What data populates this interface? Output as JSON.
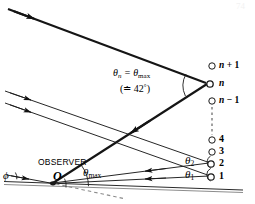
{
  "figure": {
    "background_color": "#ffffff",
    "ink_color": "#000000",
    "width": 255,
    "height": 204
  },
  "labels": {
    "observer": "OBSERVER",
    "origin": "O",
    "phi": "ϕ",
    "theta_max_lower": "θ",
    "theta_max_lower_sub": "max",
    "formula_lead": "θ",
    "formula_lead_sub": "n",
    "formula_eq": " = θ",
    "formula_eq_sub": "max",
    "formula_paren": "(≐ 42",
    "formula_paren_deg": "°",
    "formula_paren_close": ")",
    "theta_one": "θ",
    "theta_one_sub": "1",
    "theta_two": "θ",
    "theta_two_sub": "2",
    "corner_mark": "74"
  },
  "drop_column": {
    "description": "Vertical column of raindrops drawn as small open circles with index labels",
    "items": [
      {
        "id": "n-plus-1",
        "label_prefix": "n",
        "label_suffix": " + 1",
        "cx": 212,
        "cy": 66,
        "r": 3.2,
        "filled": false
      },
      {
        "id": "n",
        "label_prefix": "n",
        "label_suffix": "",
        "cx": 212,
        "cy": 84,
        "r": 3.2,
        "filled": false
      },
      {
        "id": "n-minus-1",
        "label_prefix": "n",
        "label_suffix": " − 1",
        "cx": 212,
        "cy": 101,
        "r": 3.2,
        "filled": false
      },
      {
        "id": "drop-4",
        "label_prefix": "4",
        "label_suffix": "",
        "cx": 212,
        "cy": 140,
        "r": 3.2,
        "filled": false
      },
      {
        "id": "drop-3",
        "label_prefix": "3",
        "label_suffix": "",
        "cx": 212,
        "cy": 152,
        "r": 3.2,
        "filled": false
      },
      {
        "id": "drop-2",
        "label_prefix": "2",
        "label_suffix": "",
        "cx": 212,
        "cy": 164,
        "r": 3.2,
        "filled": false
      },
      {
        "id": "drop-1",
        "label_prefix": "1",
        "label_suffix": "",
        "cx": 212,
        "cy": 177,
        "r": 3.2,
        "filled": false
      }
    ],
    "dashed_connector": {
      "x": 212,
      "y_from": 106,
      "y_to": 135
    }
  },
  "rays": {
    "incoming_top": {
      "from": [
        8,
        9
      ],
      "to": [
        208,
        84
      ],
      "width": 2.0,
      "arrow_at": [
        27,
        16
      ]
    },
    "reflected_down": {
      "from": [
        208,
        84
      ],
      "to": [
        52,
        183
      ],
      "width": 2.0,
      "arrow_at": [
        128,
        107
      ]
    },
    "incoming_mid_a": {
      "from": [
        6,
        92
      ],
      "to": [
        210,
        163
      ],
      "width": 1.0,
      "arrow_at": [
        24,
        98
      ]
    },
    "incoming_mid_b": {
      "from": [
        6,
        104
      ],
      "to": [
        210,
        176
      ],
      "width": 1.0,
      "arrow_at": [
        24,
        110
      ]
    },
    "to_observer_2": {
      "from": [
        210,
        163
      ],
      "to": [
        52,
        183
      ],
      "width": 1.0,
      "arrow_at": [
        146,
        171
      ]
    },
    "to_observer_1": {
      "from": [
        210,
        176
      ],
      "to": [
        52,
        183
      ],
      "width": 1.0,
      "arrow_at": [
        146,
        179
      ]
    },
    "horizon_line": {
      "from": [
        4,
        182
      ],
      "to": [
        240,
        190
      ],
      "width": 1.0
    },
    "phi_ray": {
      "from": [
        8,
        176
      ],
      "to": [
        52,
        183
      ],
      "width": 1.0,
      "arrow_at": [
        26,
        179
      ]
    },
    "dashed_axis": {
      "from": [
        56,
        184
      ],
      "to": [
        124,
        199
      ]
    }
  },
  "angle_arcs": [
    {
      "id": "arc-theta-max",
      "cx": 52,
      "cy": 183,
      "r": 36,
      "note": "angle at observer between horizon and upward ray"
    },
    {
      "id": "arc-phi",
      "cx": 8,
      "cy": 177,
      "r": 9,
      "note": "phi angle at far left"
    },
    {
      "id": "arc-theta-n",
      "cx": 208,
      "cy": 84,
      "r": 24,
      "note": "angle at drop n"
    },
    {
      "id": "arc-theta-1",
      "cx": 210,
      "cy": 176,
      "r": 16,
      "note": "angle near drop 1"
    },
    {
      "id": "arc-theta-2",
      "cx": 210,
      "cy": 163,
      "r": 16,
      "note": "angle near drop 2"
    }
  ]
}
